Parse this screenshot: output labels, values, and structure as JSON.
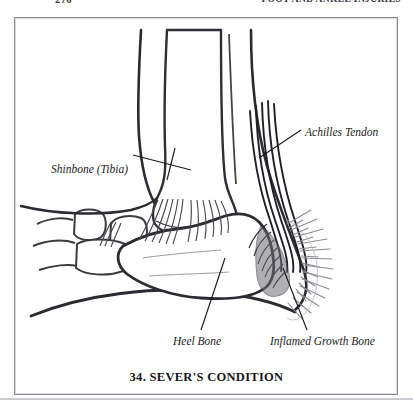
{
  "page": {
    "folio": "276",
    "running_head": "FOOT AND ANKLE INJURIES",
    "background_color": "#ffffff",
    "ink_color": "#1b1b20"
  },
  "figure": {
    "caption": "34. SEVER'S CONDITION",
    "frame_color": "#8d8d92",
    "labels": [
      {
        "id": "shinbone",
        "text": "Shinbone (Tibia)",
        "position": "left",
        "leader_to": "distal tibia shaft"
      },
      {
        "id": "achilles",
        "text": "Achilles Tendon",
        "position": "upper-right",
        "leader_to": "achilles tendon fibers"
      },
      {
        "id": "heel",
        "text": "Heel Bone",
        "position": "bottom-center",
        "leader_to": "calcaneus body"
      },
      {
        "id": "growth",
        "text": "Inflamed Growth Bone",
        "position": "bottom-right",
        "leader_to": "calcaneal growth plate"
      }
    ]
  }
}
